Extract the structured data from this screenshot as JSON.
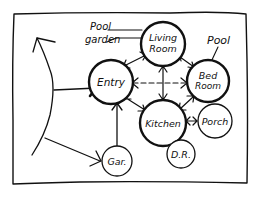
{
  "diagram": {
    "type": "bubble-diagram",
    "style": "hand-drawn",
    "ink_color": "#111111",
    "background": "#ffffff",
    "rooms": [
      {
        "id": "living",
        "lines": [
          "Living",
          "Room"
        ]
      },
      {
        "id": "entry",
        "lines": [
          "Entry"
        ]
      },
      {
        "id": "bed",
        "lines": [
          "Bed",
          "Room"
        ]
      },
      {
        "id": "kitchen",
        "lines": [
          "Kitchen"
        ]
      },
      {
        "id": "porch",
        "lines": [
          "Porch"
        ]
      },
      {
        "id": "dr",
        "lines": [
          "D.R."
        ]
      },
      {
        "id": "gar",
        "lines": [
          "Gar."
        ]
      }
    ],
    "annotations": {
      "pool_garden": [
        "Pool",
        "garden"
      ],
      "pool": "Pool"
    },
    "connections": [
      {
        "from": "entry",
        "to": "living",
        "style": "solid",
        "arrows": "both"
      },
      {
        "from": "living",
        "to": "bed",
        "style": "solid",
        "arrows": "both"
      },
      {
        "from": "living",
        "to": "kitchen",
        "style": "solid",
        "arrows": "both"
      },
      {
        "from": "entry",
        "to": "bed",
        "style": "dashed",
        "arrows": "both"
      },
      {
        "from": "entry",
        "to": "kitchen",
        "style": "solid",
        "arrows": "both"
      },
      {
        "from": "bed",
        "to": "kitchen",
        "style": "solid",
        "arrows": "both"
      },
      {
        "from": "kitchen",
        "to": "porch",
        "style": "solid",
        "arrows": "both"
      },
      {
        "from": "gar",
        "to": "entry",
        "style": "solid",
        "arrows": "end"
      },
      {
        "from": "outside",
        "to": "entry",
        "style": "solid",
        "arrows": "end"
      },
      {
        "from": "outside",
        "to": "gar",
        "style": "solid",
        "arrows": "end"
      }
    ]
  }
}
